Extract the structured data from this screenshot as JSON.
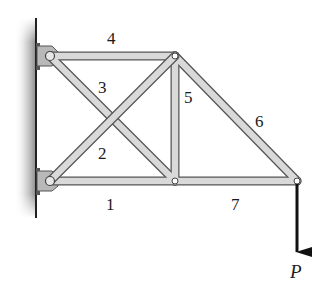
{
  "diagram": {
    "colors": {
      "member_fill": "#d9d9d9",
      "member_edge": "#555555",
      "wall_line": "#222222",
      "wall_shade": "#9a9a9a",
      "bracket": "#b8b8b8",
      "load_arrow": "#111111",
      "text": "#1a1a1a"
    },
    "joints": [
      {
        "id": "A",
        "x": 50,
        "y": 56,
        "desc": "top-left support pin"
      },
      {
        "id": "B",
        "x": 50,
        "y": 181,
        "desc": "bottom-left support pin"
      },
      {
        "id": "C",
        "x": 175,
        "y": 56,
        "desc": "top-middle joint"
      },
      {
        "id": "D",
        "x": 175,
        "y": 181,
        "desc": "bottom-middle joint"
      },
      {
        "id": "E",
        "x": 297,
        "y": 181,
        "desc": "right tip joint (load point)"
      }
    ],
    "members": [
      {
        "label": "1",
        "from": "B",
        "to": "D"
      },
      {
        "label": "2",
        "from": "B",
        "to": "C"
      },
      {
        "label": "3",
        "from": "A",
        "to": "D"
      },
      {
        "label": "4",
        "from": "A",
        "to": "C"
      },
      {
        "label": "5",
        "from": "C",
        "to": "D"
      },
      {
        "label": "6",
        "from": "C",
        "to": "E"
      },
      {
        "label": "7",
        "from": "D",
        "to": "E"
      }
    ],
    "member_labels": {
      "m1": "1",
      "m2": "2",
      "m3": "3",
      "m4": "4",
      "m5": "5",
      "m6": "6",
      "m7": "7"
    },
    "load": {
      "label": "P",
      "direction": "down",
      "at_joint": "E"
    },
    "support": {
      "type": "wall",
      "side": "left"
    }
  }
}
